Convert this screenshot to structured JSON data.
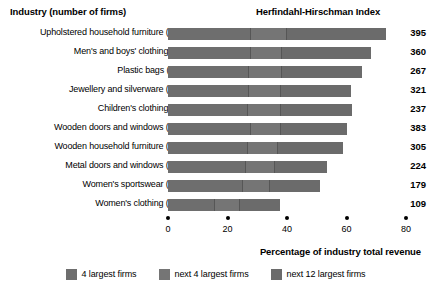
{
  "headers": {
    "industry": "Industry (number of firms)",
    "hhi": "Herfindahl-Hirschman Index"
  },
  "axis": {
    "title": "Percentage of industry total revenue",
    "ticks": [
      "0",
      "20",
      "40",
      "60",
      "80"
    ]
  },
  "legend": [
    {
      "label": "4 largest firms",
      "color": "#6e6e6e"
    },
    {
      "label": "next 4 largest firms",
      "color": "#757575"
    },
    {
      "label": "next 12 largest firms",
      "color": "#6b6b6b"
    }
  ],
  "rows": [
    {
      "label": "Upholstered household furniture (122)",
      "hhi": "395",
      "s1": 27.5,
      "s2": 12.0,
      "s3": 33.8,
      "total": 73.3
    },
    {
      "label": "Men's and boys' clothing (97)",
      "hhi": "360",
      "s1": 27.5,
      "s2": 10.5,
      "s3": 30.3,
      "total": 68.3
    },
    {
      "label": "Plastic bags (112)",
      "hhi": "267",
      "s1": 27.0,
      "s2": 11.0,
      "s3": 27.2,
      "total": 65.2
    },
    {
      "label": "Jewellery and silverware (302)",
      "hhi": "321",
      "s1": 27.0,
      "s2": 10.5,
      "s3": 24.0,
      "total": 61.5
    },
    {
      "label": "Children's clothing (96)",
      "hhi": "237",
      "s1": 26.5,
      "s2": 11.0,
      "s3": 24.3,
      "total": 61.8
    },
    {
      "label": "Wooden doors and windows (282)",
      "hhi": "383",
      "s1": 27.5,
      "s2": 10.0,
      "s3": 22.7,
      "total": 60.2
    },
    {
      "label": "Wooden household furniture (440)",
      "hhi": "305",
      "s1": 26.5,
      "s2": 10.0,
      "s3": 22.3,
      "total": 58.8
    },
    {
      "label": "Metal doors and windows (287)",
      "hhi": "224",
      "s1": 26.0,
      "s2": 9.5,
      "s3": 18.0,
      "total": 53.5
    },
    {
      "label": "Women's sportswear (191)",
      "hhi": "179",
      "s1": 25.0,
      "s2": 9.0,
      "s3": 17.1,
      "total": 51.1
    },
    {
      "label": "Women's clothing (410)",
      "hhi": "109",
      "s1": 15.5,
      "s2": 8.5,
      "s3": 13.7,
      "total": 37.7
    }
  ],
  "chart_data": {
    "type": "bar",
    "orientation": "horizontal",
    "stacked": true,
    "title": "",
    "xlabel": "Percentage of industry total revenue",
    "ylabel": "Industry (number of firms)",
    "xlim": [
      0,
      80
    ],
    "xticks": [
      0,
      20,
      40,
      60,
      80
    ],
    "grid": false,
    "legend_position": "bottom",
    "categories": [
      "Upholstered household furniture (122)",
      "Men's and boys' clothing (97)",
      "Plastic bags (112)",
      "Jewellery and silverware (302)",
      "Children's clothing (96)",
      "Wooden doors and windows (282)",
      "Wooden household furniture (440)",
      "Metal doors and windows (287)",
      "Women's sportswear (191)",
      "Women's clothing (410)"
    ],
    "series": [
      {
        "name": "4 largest firms",
        "values": [
          27.5,
          27.5,
          27.0,
          27.0,
          26.5,
          27.5,
          26.5,
          26.0,
          25.0,
          15.5
        ]
      },
      {
        "name": "next 4 largest firms",
        "values": [
          12.0,
          10.5,
          11.0,
          10.5,
          11.0,
          10.0,
          10.0,
          9.5,
          9.0,
          8.5
        ]
      },
      {
        "name": "next 12 largest firms",
        "values": [
          33.8,
          30.3,
          27.2,
          24.0,
          24.3,
          22.7,
          22.3,
          18.0,
          17.1,
          13.7
        ]
      }
    ],
    "totals": [
      73.3,
      68.3,
      65.2,
      61.5,
      61.8,
      60.2,
      58.8,
      53.5,
      51.1,
      37.7
    ],
    "annotations": {
      "label": "Herfindahl-Hirschman Index",
      "values": [
        395,
        360,
        267,
        321,
        237,
        383,
        305,
        224,
        179,
        109
      ]
    }
  }
}
